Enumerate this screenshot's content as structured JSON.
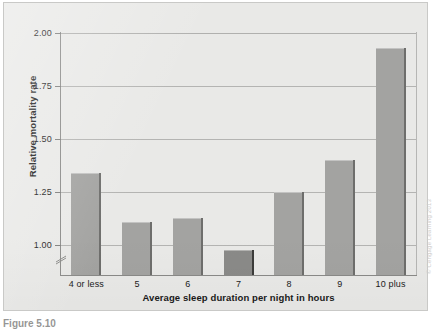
{
  "chart_data": {
    "type": "bar",
    "title": "",
    "subtitle": "",
    "xlabel": "Average sleep duration per night in hours",
    "ylabel": "Relative mortality rate",
    "categories": [
      "4 or less",
      "5",
      "6",
      "7",
      "8",
      "9",
      "10 plus"
    ],
    "values": [
      1.34,
      1.11,
      1.13,
      0.98,
      1.25,
      1.4,
      1.93
    ],
    "highlighted_index": 3,
    "ylim": [
      0.86,
      2.0
    ],
    "yticks": [
      "2.00",
      "1.75",
      "1.50",
      "1.25",
      "1.00"
    ],
    "ytick_values": [
      2.0,
      1.75,
      1.5,
      1.25,
      1.0
    ],
    "axis_break": true,
    "axis_break_position": "below 1.00",
    "grid": "horizontal",
    "legend": "none",
    "bar_color": "#a3a3a1",
    "bar_highlight_color": "#8a8a88",
    "bar_edge_color": "#6e6e6c",
    "plot_background": "#e9e9e7",
    "gridline_color": "#b4b4b2",
    "axis_color": "#8a8a88",
    "annotations": []
  },
  "figure": {
    "credit": "© Cengage Learning 2013",
    "caption": "Figure 5.10"
  }
}
